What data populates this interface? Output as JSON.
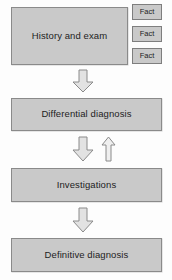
{
  "diagram": {
    "colors": {
      "box_fill": "#c9c9c9",
      "box_border": "#8a8a8a",
      "arrow_fill": "#e2e2e2",
      "arrow_border": "#8a8a8a",
      "text": "#1d1d1d",
      "background": "#fdfdfd"
    },
    "nodes": [
      {
        "id": "history",
        "label": "History and exam"
      },
      {
        "id": "differential",
        "label": "Differential diagnosis"
      },
      {
        "id": "investigations",
        "label": "Investigations"
      },
      {
        "id": "definitive",
        "label": "Definitive diagnosis"
      }
    ],
    "facts": [
      {
        "id": "fact-1",
        "label": "Fact"
      },
      {
        "id": "fact-2",
        "label": "Fact"
      },
      {
        "id": "fact-3",
        "label": "Fact"
      }
    ],
    "arrows": [
      {
        "id": "arrow-history-to-differential",
        "direction": "down"
      },
      {
        "id": "arrow-differential-to-investigations",
        "direction": "down"
      },
      {
        "id": "arrow-investigations-to-differential",
        "direction": "up"
      },
      {
        "id": "arrow-investigations-to-definitive",
        "direction": "down"
      }
    ]
  }
}
